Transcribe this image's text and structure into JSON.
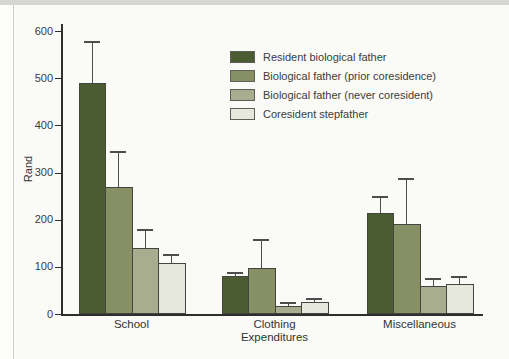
{
  "figure": {
    "background": "#fafaf7",
    "axis_color": "#2e2e2e",
    "error_bar_color": "#4d4d4d"
  },
  "chart_data": {
    "type": "bar",
    "title": "",
    "ylabel": "Rand",
    "xlabel": "Expenditures",
    "ylim": [
      0,
      600
    ],
    "yticks": [
      0,
      100,
      200,
      300,
      400,
      500,
      600
    ],
    "grid": false,
    "legend_position": "upper center",
    "error_bars": "upper",
    "categories": [
      "School",
      "Clothing",
      "Miscellaneous"
    ],
    "series": [
      {
        "name": "Resident biological father",
        "color": "#4b5c33",
        "values": [
          490,
          80,
          215
        ],
        "errors_upper": [
          88,
          10,
          35
        ]
      },
      {
        "name": "Biological father (prior coresidence)",
        "color": "#879064",
        "values": [
          270,
          97,
          190
        ],
        "errors_upper": [
          75,
          61,
          98
        ]
      },
      {
        "name": "Biological father (never coresident)",
        "color": "#a9ad90",
        "values": [
          140,
          18,
          60
        ],
        "errors_upper": [
          40,
          8,
          17
        ]
      },
      {
        "name": "Coresident stepfather",
        "color": "#e6e8dd",
        "values": [
          108,
          26,
          63
        ],
        "errors_upper": [
          20,
          7,
          17
        ]
      }
    ]
  }
}
